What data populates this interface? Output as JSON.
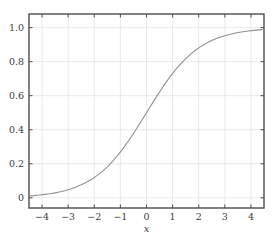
{
  "figure": {
    "background_color": "#ffffff",
    "frame_color": "#4d4d4d",
    "grid_color": "#e3e3e3",
    "curve_color": "#8f8f8f",
    "tick_text_color": "#3a3a3a"
  },
  "chart_data": {
    "type": "line",
    "title": "",
    "subtitle": "",
    "xlabel": "x",
    "ylabel": "",
    "xlim": [
      -4.5,
      4.5
    ],
    "ylim": [
      -0.06,
      1.08
    ],
    "grid": true,
    "legend": null,
    "legend_position": "none",
    "xticks": [
      -4,
      -3,
      -2,
      -1,
      0,
      1,
      2,
      3,
      4
    ],
    "xtick_labels": [
      "−4",
      "−3",
      "−2",
      "−1",
      "0",
      "1",
      "2",
      "3",
      "4"
    ],
    "yticks": [
      0,
      0.2,
      0.4,
      0.6,
      0.8,
      1.0
    ],
    "ytick_labels": [
      "0",
      "0.2",
      "0.4",
      "0.6",
      "0.8",
      "1.0"
    ],
    "series": [
      {
        "name": "sigmoid",
        "color": "#8f8f8f",
        "linewidth": 1.1,
        "x": [
          -4.5,
          -4.3,
          -4.1,
          -3.9,
          -3.7,
          -3.5,
          -3.3,
          -3.1,
          -2.9,
          -2.7,
          -2.5,
          -2.3,
          -2.1,
          -1.9,
          -1.7,
          -1.5,
          -1.3,
          -1.1,
          -0.9,
          -0.7,
          -0.5,
          -0.3,
          -0.1,
          0.1,
          0.3,
          0.5,
          0.7,
          0.9,
          1.1,
          1.3,
          1.5,
          1.7,
          1.9,
          2.1,
          2.3,
          2.5,
          2.7,
          2.9,
          3.1,
          3.3,
          3.5,
          3.7,
          3.9,
          4.1,
          4.3,
          4.5
        ],
        "y": [
          0.011,
          0.013,
          0.016,
          0.02,
          0.024,
          0.029,
          0.035,
          0.043,
          0.052,
          0.063,
          0.076,
          0.091,
          0.109,
          0.13,
          0.154,
          0.182,
          0.214,
          0.25,
          0.289,
          0.332,
          0.378,
          0.426,
          0.475,
          0.525,
          0.574,
          0.622,
          0.668,
          0.711,
          0.75,
          0.786,
          0.818,
          0.846,
          0.87,
          0.891,
          0.909,
          0.924,
          0.937,
          0.948,
          0.957,
          0.964,
          0.971,
          0.976,
          0.98,
          0.984,
          0.987,
          0.989
        ]
      }
    ]
  }
}
